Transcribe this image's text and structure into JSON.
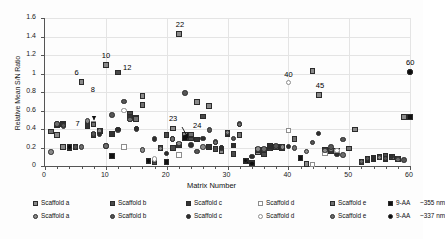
{
  "chart_data": {
    "type": "scatter",
    "title": "",
    "xlabel": "Matrix Number",
    "ylabel": "Relative Mean S/N Ratio",
    "xlim": [
      0,
      60
    ],
    "ylim": [
      0,
      1.6
    ],
    "xticks": [
      "0",
      "10",
      "20",
      "30",
      "40",
      "50",
      "60"
    ],
    "yticks": [
      "0",
      "0.2",
      "0.4",
      "0.6",
      "0.8",
      "1",
      "1.2",
      "1.4",
      "1.6"
    ],
    "grid": true,
    "legend_position": "bottom",
    "annotations": [
      {
        "label": "6",
        "x": 6,
        "y": 0.905
      },
      {
        "label": "7",
        "x": 7,
        "y": 0.46
      },
      {
        "label": "8",
        "x": 8,
        "y": 0.575
      },
      {
        "label": "10",
        "x": 10,
        "y": 1.09
      },
      {
        "label": "12",
        "x": 12,
        "y": 1.01
      },
      {
        "label": "22",
        "x": 22,
        "y": 1.43
      },
      {
        "label": "23",
        "x": 23,
        "y": 0.24
      },
      {
        "label": "24",
        "x": 24,
        "y": 0.31
      },
      {
        "label": "40",
        "x": 40,
        "y": 0.9
      },
      {
        "label": "45",
        "x": 45,
        "y": 0.77
      },
      {
        "label": "60",
        "x": 60,
        "y": 1.015
      }
    ],
    "series": [
      {
        "name": "Scaffold a",
        "marker": "square",
        "color": "#8a8a8a",
        "points": [
          [
            1,
            0.375
          ],
          [
            2,
            0.335
          ],
          [
            3,
            0.205
          ],
          [
            4,
            0.205
          ],
          [
            6,
            0.905
          ],
          [
            8,
            0.455
          ],
          [
            10,
            1.09
          ],
          [
            11,
            0.105
          ],
          [
            13,
            0.205
          ],
          [
            15,
            0.52
          ],
          [
            16,
            0.755
          ],
          [
            17,
            0.055
          ],
          [
            19,
            0.19
          ],
          [
            21,
            0.405
          ],
          [
            22,
            1.43
          ],
          [
            23,
            0.335
          ],
          [
            25,
            0.695
          ],
          [
            27,
            0.65
          ],
          [
            29,
            0.155
          ],
          [
            30,
            0.355
          ],
          [
            32,
            0.34
          ],
          [
            35,
            0.145
          ],
          [
            36,
            0.175
          ],
          [
            38,
            0.21
          ],
          [
            40,
            0.385
          ],
          [
            41,
            0.295
          ],
          [
            43,
            0.02
          ],
          [
            44,
            1.03
          ],
          [
            45,
            0.77
          ],
          [
            46,
            0.175
          ],
          [
            48,
            0.155
          ],
          [
            51,
            0.395
          ],
          [
            53,
            0.065
          ],
          [
            55,
            0.09
          ],
          [
            57,
            0.095
          ],
          [
            59,
            0.53
          ]
        ]
      },
      {
        "name": "Scaffold b",
        "marker": "square",
        "color": "#4a4a4a",
        "points": [
          [
            2,
            0.44
          ],
          [
            3,
            0.455
          ],
          [
            4,
            0.205
          ],
          [
            7,
            0.455
          ],
          [
            8,
            0.335
          ],
          [
            12,
            1.01
          ],
          [
            14,
            0.565
          ],
          [
            15,
            0.51
          ],
          [
            16,
            0.66
          ],
          [
            18,
            0.04
          ],
          [
            20,
            0.335
          ],
          [
            21,
            0.195
          ],
          [
            23,
            0.305
          ],
          [
            24,
            0.305
          ],
          [
            26,
            0.535
          ],
          [
            28,
            0.185
          ],
          [
            30,
            0.345
          ],
          [
            31,
            0.13
          ],
          [
            33,
            0.06
          ],
          [
            36,
            0.125
          ],
          [
            37,
            0.195
          ],
          [
            39,
            0.205
          ],
          [
            42,
            0.085
          ],
          [
            46,
            0.17
          ],
          [
            48,
            0.165
          ],
          [
            52,
            0.045
          ],
          [
            54,
            0.07
          ],
          [
            56,
            0.105
          ],
          [
            58,
            0.075
          ]
        ]
      },
      {
        "name": "Scaffold c",
        "marker": "square",
        "color": "#333333",
        "points": [
          [
            3,
            0.45
          ],
          [
            4,
            0.195
          ],
          [
            7,
            0.43
          ],
          [
            9,
            0.38
          ],
          [
            11,
            0.345
          ],
          [
            14,
            0.535
          ],
          [
            17,
            0.06
          ],
          [
            20,
            0.045
          ],
          [
            22,
            0.23
          ],
          [
            24,
            0.335
          ],
          [
            25,
            0.285
          ],
          [
            27,
            0.205
          ],
          [
            31,
            0.22
          ],
          [
            34,
            0.03
          ],
          [
            35,
            0.175
          ],
          [
            37,
            0.215
          ],
          [
            39,
            0.19
          ],
          [
            47,
            0.165
          ],
          [
            53,
            0.075
          ],
          [
            54,
            0.085
          ],
          [
            56,
            0.075
          ]
        ]
      },
      {
        "name": "Scaffold d",
        "marker": "square-open",
        "color": "#d6d6d6",
        "points": [
          [
            8,
            0.455
          ],
          [
            13,
            0.205
          ],
          [
            22,
            0.12
          ],
          [
            40,
            0.385
          ],
          [
            44,
            0.015
          ],
          [
            46,
            0.135
          ],
          [
            48,
            0.155
          ]
        ]
      },
      {
        "name": "Scaffold e",
        "marker": "square",
        "color": "#707070",
        "points": [
          [
            1,
            0.375
          ],
          [
            5,
            0.205
          ],
          [
            8,
            0.45
          ],
          [
            15,
            0.51
          ],
          [
            16,
            0.66
          ],
          [
            19,
            0.195
          ],
          [
            24,
            0.34
          ],
          [
            30,
            0.355
          ],
          [
            32,
            0.335
          ],
          [
            36,
            0.175
          ],
          [
            38,
            0.205
          ],
          [
            41,
            0.295
          ],
          [
            50,
            0.19
          ],
          [
            55,
            0.095
          ],
          [
            57,
            0.1
          ]
        ]
      },
      {
        "name": "9-AA  ~355 nm",
        "marker": "square",
        "color": "#111111",
        "points": [
          [
            4,
            0.205
          ],
          [
            11,
            0.105
          ],
          [
            17,
            0.06
          ],
          [
            20,
            0.045
          ],
          [
            23,
            0.305
          ],
          [
            33,
            0.055
          ],
          [
            42,
            0.085
          ],
          [
            60,
            0.53
          ]
        ]
      },
      {
        "name": "Scaffold a",
        "marker": "circle",
        "color": "#8a8a8a",
        "points": [
          [
            1,
            0.15
          ],
          [
            2,
            0.455
          ],
          [
            3,
            0.43
          ],
          [
            7,
            0.485
          ],
          [
            9,
            0.38
          ],
          [
            10,
            0.215
          ],
          [
            12,
            0.39
          ],
          [
            14,
            0.5
          ],
          [
            16,
            0.175
          ],
          [
            18,
            0.065
          ],
          [
            19,
            0.19
          ],
          [
            22,
            0.24
          ],
          [
            26,
            0.205
          ],
          [
            28,
            0.26
          ],
          [
            30,
            0.36
          ],
          [
            32,
            0.455
          ],
          [
            35,
            0.185
          ],
          [
            37,
            0.195
          ],
          [
            39,
            0.205
          ],
          [
            43,
            0.155
          ],
          [
            46,
            0.17
          ],
          [
            47,
            0.18
          ],
          [
            52,
            0.045
          ],
          [
            55,
            0.09
          ],
          [
            58,
            0.08
          ]
        ]
      },
      {
        "name": "Scaffold b",
        "marker": "circle",
        "color": "#555555",
        "points": [
          [
            3,
            0.44
          ],
          [
            5,
            0.205
          ],
          [
            8,
            0.345
          ],
          [
            11,
            0.55
          ],
          [
            13,
            0.7
          ],
          [
            15,
            0.4
          ],
          [
            17,
            0.055
          ],
          [
            21,
            0.29
          ],
          [
            23,
            0.79
          ],
          [
            25,
            0.16
          ],
          [
            27,
            0.39
          ],
          [
            29,
            0.195
          ],
          [
            31,
            0.3
          ],
          [
            33,
            0.06
          ],
          [
            34,
            0.035
          ],
          [
            36,
            0.18
          ],
          [
            38,
            0.215
          ],
          [
            44,
            0.255
          ],
          [
            47,
            0.205
          ],
          [
            49,
            0.285
          ],
          [
            53,
            0.08
          ],
          [
            56,
            0.08
          ],
          [
            59,
            0.065
          ]
        ]
      },
      {
        "name": "Scaffold c",
        "marker": "circle",
        "color": "#2e2e2e",
        "points": [
          [
            2,
            0.44
          ],
          [
            4,
            0.2
          ],
          [
            9,
            0.34
          ],
          [
            12,
            0.395
          ],
          [
            15,
            0.405
          ],
          [
            18,
            0.29
          ],
          [
            20,
            0.135
          ],
          [
            24,
            0.225
          ],
          [
            26,
            0.3
          ],
          [
            29,
            0.2
          ],
          [
            31,
            0.22
          ],
          [
            34,
            0.1
          ],
          [
            37,
            0.2
          ],
          [
            40,
            0.21
          ],
          [
            45,
            0.35
          ],
          [
            48,
            0.125
          ],
          [
            54,
            0.085
          ],
          [
            57,
            0.1
          ],
          [
            60,
            1.015
          ]
        ]
      },
      {
        "name": "Scaffold d",
        "marker": "circle-open",
        "color": "#e0e0e0",
        "points": [
          [
            13,
            0.6
          ],
          [
            18,
            0.075
          ],
          [
            40,
            0.9
          ],
          [
            48,
            0.17
          ]
        ]
      },
      {
        "name": "Scaffold e",
        "marker": "circle",
        "color": "#6d6d6d",
        "points": [
          [
            2,
            0.455
          ],
          [
            6,
            0.205
          ],
          [
            10,
            0.215
          ],
          [
            14,
            0.5
          ],
          [
            21,
            0.29
          ],
          [
            28,
            0.255
          ],
          [
            32,
            0.45
          ],
          [
            36,
            0.185
          ],
          [
            41,
            0.195
          ],
          [
            49,
            0.12
          ],
          [
            52,
            0.05
          ],
          [
            58,
            0.07
          ]
        ]
      },
      {
        "name": "9-AA  ~337 nm",
        "marker": "circle",
        "color": "#0d0d0d",
        "points": [
          [
            4,
            0.205
          ],
          [
            17,
            0.055
          ],
          [
            33,
            0.06
          ],
          [
            34,
            0.03
          ],
          [
            60,
            1.015
          ]
        ]
      }
    ]
  },
  "legend": {
    "rows": [
      [
        {
          "marker": "square",
          "color": "#8a8a8a",
          "label": "Scaffold a"
        },
        {
          "marker": "square",
          "color": "#4a4a4a",
          "label": "Scaffold b"
        },
        {
          "marker": "square",
          "color": "#333333",
          "label": "Scaffold c"
        },
        {
          "marker": "square-open",
          "color": "#d6d6d6",
          "label": "Scaffold d"
        },
        {
          "marker": "square",
          "color": "#707070",
          "label": "Scaffold e"
        },
        {
          "marker": "square",
          "color": "#111111",
          "label": "9-AA",
          "extra": "~355 nm"
        }
      ],
      [
        {
          "marker": "circle",
          "color": "#8a8a8a",
          "label": "Scaffold a"
        },
        {
          "marker": "circle",
          "color": "#555555",
          "label": "Scaffold b"
        },
        {
          "marker": "circle",
          "color": "#2e2e2e",
          "label": "Scaffold c"
        },
        {
          "marker": "circle-open",
          "color": "#e0e0e0",
          "label": "Scaffold d"
        },
        {
          "marker": "circle",
          "color": "#6d6d6d",
          "label": "Scaffold e"
        },
        {
          "marker": "circle",
          "color": "#0d0d0d",
          "label": "9-AA",
          "extra": "~337 nm"
        }
      ]
    ]
  }
}
